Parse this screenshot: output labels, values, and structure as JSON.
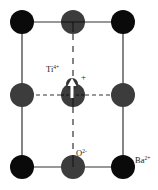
{
  "diagram": {
    "type": "crystal-unit-cell-cross-section",
    "labels": {
      "ti": {
        "base": "Ti",
        "sup": "4+"
      },
      "ti_charge": "+",
      "oxygen": {
        "base": "O",
        "sup": "2-"
      },
      "barium": {
        "base": "Ba",
        "sup": "2+"
      }
    },
    "colors": {
      "barium": "#0a0a0a",
      "oxygen": "#3c3c3c",
      "titanium": "#333333",
      "lines": "#333333",
      "arrow": "#ffffff"
    },
    "atoms": [
      {
        "id": "ba-top-left",
        "species": "Ba",
        "x": 22,
        "y": 22
      },
      {
        "id": "o-top-mid",
        "species": "O",
        "x": 73,
        "y": 22
      },
      {
        "id": "ba-top-right",
        "species": "Ba",
        "x": 123,
        "y": 22
      },
      {
        "id": "o-mid-left",
        "species": "O",
        "x": 22,
        "y": 95
      },
      {
        "id": "o-center",
        "species": "O",
        "x": 73,
        "y": 95
      },
      {
        "id": "o-mid-right",
        "species": "O",
        "x": 123,
        "y": 95
      },
      {
        "id": "ba-bottom-left",
        "species": "Ba",
        "x": 22,
        "y": 167
      },
      {
        "id": "o-bottom-mid",
        "species": "O",
        "x": 73,
        "y": 167
      },
      {
        "id": "ba-bottom-right",
        "species": "Ba",
        "x": 123,
        "y": 167
      }
    ],
    "ti_ion": {
      "x": 72,
      "y": 84,
      "displacement": "up"
    }
  }
}
